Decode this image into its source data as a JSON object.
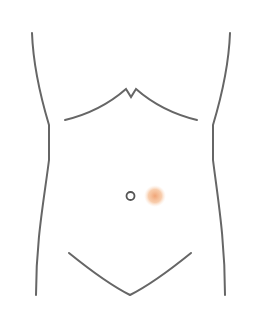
{
  "diagram": {
    "line_color": "#666666",
    "marker": {
      "label": "pain location",
      "color": "#f0a070",
      "region": "periumbilical right"
    },
    "navel_color": "#555555"
  }
}
